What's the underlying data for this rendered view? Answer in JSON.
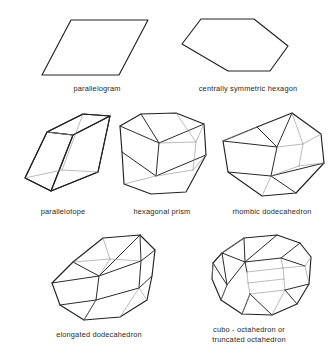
{
  "figure": {
    "kind": "line-diagram",
    "background_color": "#ffffff",
    "ink_color": "#222222",
    "hidden_edge_color": "#8d8d8d",
    "rows": 3,
    "shape_count": 7
  },
  "shapes": [
    {
      "id": "parallelogram",
      "label": "parallelogram",
      "row": 1,
      "dimension": "2D",
      "label_x": 97,
      "label_y": 84
    },
    {
      "id": "centrally-symmetric-hexagon",
      "label": "centrally symmetric hexagon",
      "row": 1,
      "dimension": "2D",
      "label_x": 248,
      "label_y": 84
    },
    {
      "id": "parallelotope",
      "label": "parallelotope",
      "row": 2,
      "dimension": "3D",
      "label_x": 63,
      "label_y": 207
    },
    {
      "id": "hexagonal-prism",
      "label": "hexagonal prism",
      "row": 2,
      "dimension": "3D",
      "label_x": 162,
      "label_y": 207
    },
    {
      "id": "rhombic-dodecahedron",
      "label": "rhombic dodecahedron",
      "row": 2,
      "dimension": "3D",
      "label_x": 272,
      "label_y": 207
    },
    {
      "id": "elongated-dodecahedron",
      "label": "elongated dodecahedron",
      "row": 3,
      "dimension": "3D",
      "label_x": 99,
      "label_y": 330
    },
    {
      "id": "cubo-octahedron",
      "label": "cubo - octahedron or",
      "label_line2": "truncated octahedron",
      "row": 3,
      "dimension": "3D",
      "label_x": 249,
      "label_y": 330
    }
  ]
}
